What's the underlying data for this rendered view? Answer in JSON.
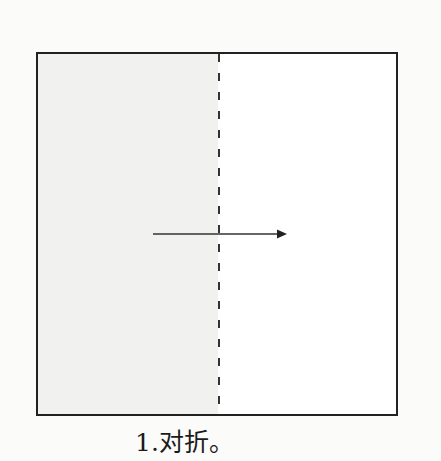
{
  "diagram": {
    "step_caption": "1.对折。",
    "fold_direction": "left-to-right",
    "elements": {
      "square_paper": "paper-square",
      "fold_line": "dashed-vertical-center-line",
      "arrow": "arrow-right-icon"
    },
    "colors": {
      "outline": "#222222",
      "shaded_half": "#f1f1f0",
      "unshaded_half": "#ffffff"
    }
  }
}
